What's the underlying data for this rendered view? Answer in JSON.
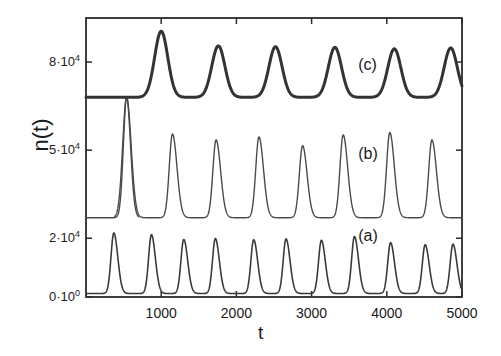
{
  "figure": {
    "background_color": "#ffffff",
    "axis_color": "#2b2b2b",
    "text_color": "#1a1a1a"
  },
  "axes": {
    "xlabel": "t",
    "ylabel": "n(t)",
    "x_ticks": [
      {
        "value": 1000,
        "label": "1000"
      },
      {
        "value": 2000,
        "label": "2000"
      },
      {
        "value": 3000,
        "label": "3000"
      },
      {
        "value": 4000,
        "label": "4000"
      },
      {
        "value": 5000,
        "label": "5000"
      }
    ],
    "y_ticks": [
      {
        "value": 80000,
        "mantissa": "8",
        "exponent": "4",
        "label": "8·10"
      },
      {
        "value": 50000,
        "mantissa": "5",
        "exponent": "4",
        "label": "5·10"
      },
      {
        "value": 20000,
        "mantissa": "2",
        "exponent": "4",
        "label": "2·10"
      },
      {
        "value": 0,
        "mantissa": "0",
        "exponent": "0",
        "label": "0·10"
      }
    ]
  },
  "annotations": [
    {
      "name": "curve-label-c",
      "text": "(c)",
      "x": 3620,
      "y": 78500
    },
    {
      "name": "curve-label-b",
      "text": "(b)",
      "x": 3620,
      "y": 48200
    },
    {
      "name": "curve-label-a",
      "text": "(a)",
      "x": 3620,
      "y": 20300
    }
  ],
  "chart_data": {
    "type": "line",
    "title": "",
    "xlabel": "t",
    "ylabel": "n(t)",
    "xlim": [
      0,
      5000
    ],
    "ylim": [
      0,
      95000
    ],
    "grid": false,
    "legend": "inline-annotations",
    "x_tick_values": [
      1000,
      2000,
      3000,
      4000,
      5000
    ],
    "y_tick_values": [
      0,
      20000,
      50000,
      80000
    ],
    "series": [
      {
        "name": "(a)",
        "color": "#3a3a3a",
        "line_width": 1.6,
        "baseline": 1200,
        "peak_amplitude": 20500,
        "period": 420,
        "first_peak_x": 370,
        "description": "relaxation oscillation, sharp spikes from near 0 to about 2e4",
        "peaks_x": [
          370,
          870,
          1300,
          1720,
          2230,
          2660,
          3130,
          3570,
          4050,
          4510,
          4880
        ],
        "peaks_y": [
          21800,
          21200,
          19600,
          19900,
          19500,
          19800,
          19300,
          20600,
          18500,
          17800,
          18000
        ]
      },
      {
        "name": "(b)",
        "color": "#4a4a4a",
        "line_width": 1.4,
        "baseline": 27000,
        "peak_amplitude": 55500,
        "period": 570,
        "first_peak_x": 540,
        "description": "offset oscillation with tall initial transient spike near t=540 reaching about 6.8e4",
        "transient_spike": {
          "x": 540,
          "y": 68000
        },
        "peaks_x": [
          540,
          1150,
          1730,
          2300,
          2880,
          3420,
          4040,
          4600
        ],
        "peaks_y": [
          68000,
          55500,
          53500,
          54500,
          51500,
          55200,
          56000,
          53500
        ]
      },
      {
        "name": "(c)",
        "color": "#333333",
        "line_width": 3.0,
        "baseline": 68000,
        "peak_amplitude": 90000,
        "period": 760,
        "first_peak_x": 1000,
        "description": "thick trace, broad peaks on a raised baseline near 6.8e4",
        "peaks_x": [
          1000,
          1760,
          2520,
          3310,
          4100,
          4850
        ],
        "peaks_y": [
          90500,
          85500,
          85200,
          85000,
          84500,
          84800
        ]
      }
    ]
  }
}
